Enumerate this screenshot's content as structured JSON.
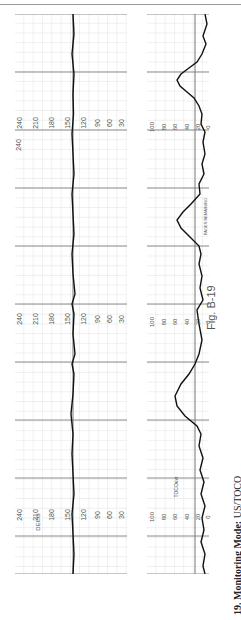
{
  "figure": {
    "label": "Fig. B-19",
    "caption_number": "19.",
    "caption_title": "Monitoring Mode:",
    "caption_value": "US/TOCO"
  },
  "fhr_strip": {
    "scale_labels": [
      "240",
      "210",
      "180",
      "150",
      "120",
      "90",
      "60",
      "30"
    ],
    "mode_marker": "DECG",
    "baseline_bpm": 135
  },
  "uc_strip": {
    "scale_labels": [
      "100",
      "80",
      "60",
      "40",
      "20",
      "0"
    ],
    "mode_marker": "TOCOext",
    "annotation_terms": [
      "MEDS",
      "O2",
      "IVF",
      "EPI",
      "POS",
      "VE",
      "BP",
      "PULSE",
      "TEMP",
      "IEP"
    ],
    "footer": "PAGES REMAINING"
  },
  "colors": {
    "grid_minor": "#c8c8c8",
    "grid_major": "#8c8c8c",
    "trace": "#111111",
    "text": "#555555"
  }
}
